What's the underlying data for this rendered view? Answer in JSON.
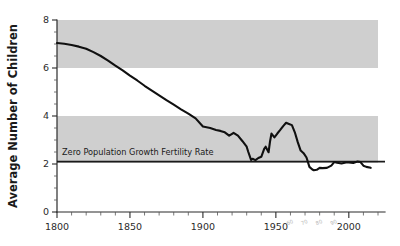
{
  "chart_data": {
    "type": "line",
    "title": "",
    "xlabel": "",
    "ylabel": "Average Number of Children",
    "xlim": [
      1800,
      2020
    ],
    "ylim": [
      0,
      8
    ],
    "grid": false,
    "legend": "none",
    "y_ticks": [
      0,
      2,
      4,
      6,
      8
    ],
    "y_tick_labels": [
      "0",
      "2",
      "4",
      "6",
      "8"
    ],
    "y_minor_tick_step": 0.5,
    "x_ticks": [
      1800,
      1850,
      1900,
      1950,
      2000
    ],
    "x_tick_labels": [
      "1800",
      "1850",
      "1900",
      "1950",
      "2000"
    ],
    "x_minor_tick_step": 10,
    "x_minor_labeled": [
      {
        "year": 1960,
        "label": "60"
      },
      {
        "year": 1970,
        "label": "70"
      },
      {
        "year": 1980,
        "label": "80"
      },
      {
        "year": 1990,
        "label": "90"
      }
    ],
    "bands": [
      {
        "name": "upper-shaded-band",
        "y0": 6.0,
        "y1": 8.0,
        "color": "#cfcfcf",
        "x0": 1800,
        "x1": 2020
      },
      {
        "name": "lower-shaded-band",
        "y0": 2.05,
        "y1": 4.0,
        "color": "#cfcfcf",
        "x0": 1800,
        "x1": 2020
      }
    ],
    "reference_line": {
      "label": "Zero Population Growth Fertility Rate",
      "value": 2.1,
      "color": "#1a1a1a"
    },
    "series": [
      {
        "name": "Total Fertility Rate",
        "color": "#101010",
        "x": [
          1800,
          1805,
          1810,
          1815,
          1820,
          1825,
          1830,
          1835,
          1840,
          1845,
          1850,
          1855,
          1860,
          1865,
          1870,
          1875,
          1880,
          1885,
          1890,
          1895,
          1900,
          1905,
          1909,
          1912,
          1915,
          1918,
          1920,
          1921,
          1924,
          1927,
          1930,
          1931,
          1933,
          1934,
          1936,
          1938,
          1940,
          1942,
          1943,
          1945,
          1946,
          1947,
          1949,
          1951,
          1953,
          1955,
          1957,
          1959,
          1961,
          1963,
          1965,
          1967,
          1969,
          1971,
          1973,
          1975,
          1976,
          1978,
          1980,
          1982,
          1985,
          1988,
          1990,
          1992,
          1995,
          1998,
          2000,
          2003,
          2006,
          2008,
          2010,
          2012,
          2015
        ],
        "values": [
          7.04,
          7.01,
          6.96,
          6.89,
          6.8,
          6.66,
          6.5,
          6.31,
          6.1,
          5.9,
          5.68,
          5.48,
          5.26,
          5.06,
          4.86,
          4.66,
          4.47,
          4.28,
          4.1,
          3.9,
          3.56,
          3.5,
          3.42,
          3.38,
          3.32,
          3.18,
          3.26,
          3.3,
          3.18,
          2.96,
          2.72,
          2.52,
          2.17,
          2.22,
          2.16,
          2.25,
          2.3,
          2.63,
          2.72,
          2.49,
          2.94,
          3.27,
          3.11,
          3.27,
          3.42,
          3.58,
          3.72,
          3.67,
          3.62,
          3.32,
          2.91,
          2.56,
          2.45,
          2.27,
          1.88,
          1.77,
          1.74,
          1.76,
          1.84,
          1.83,
          1.84,
          1.93,
          2.08,
          2.05,
          2.02,
          2.06,
          2.06,
          2.04,
          2.1,
          2.08,
          1.93,
          1.88,
          1.84
        ]
      }
    ]
  },
  "axis": {
    "y_title": "Average Number of Children"
  },
  "annotations": {
    "zpg": "Zero Population Growth Fertility Rate"
  }
}
